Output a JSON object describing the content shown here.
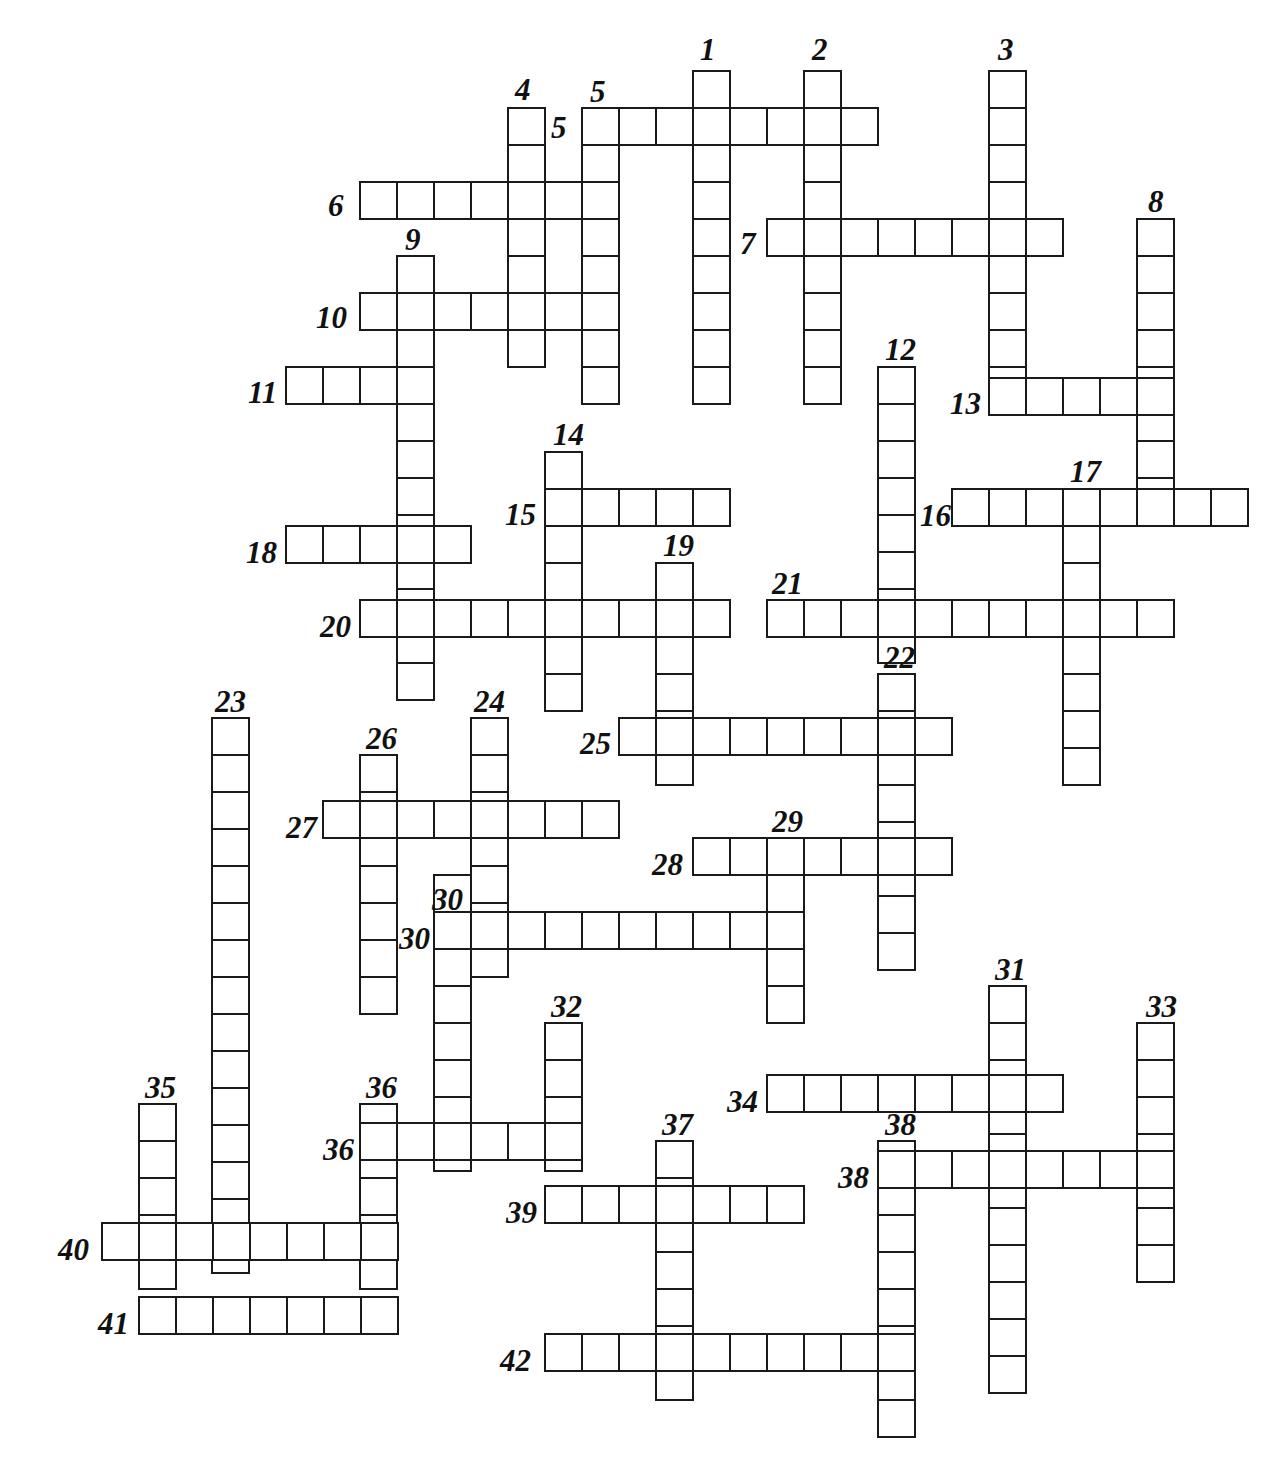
{
  "puzzle": {
    "title": "Crossword Grid",
    "cell_size": 37,
    "line_color": "#1a1a1a",
    "background": "#ffffff",
    "numbers_style": "italic handwritten",
    "entry_count": 42,
    "entries": [
      {
        "number": "1",
        "direction": "down",
        "length": 9,
        "col": 18,
        "row": 0,
        "x": 692,
        "y": 70,
        "label_x": 700,
        "label_y": 34
      },
      {
        "number": "2",
        "direction": "down",
        "length": 9,
        "col": 21,
        "row": 0,
        "x": 803,
        "y": 70,
        "label_x": 812,
        "label_y": 34
      },
      {
        "number": "3",
        "direction": "down",
        "length": 9,
        "col": 26,
        "row": 0,
        "x": 988,
        "y": 70,
        "label_x": 998,
        "label_y": 34
      },
      {
        "number": "4",
        "direction": "down",
        "length": 7,
        "col": 12,
        "row": 1,
        "x": 507,
        "y": 107,
        "label_x": 515,
        "label_y": 74
      },
      {
        "number": "5",
        "direction": "down",
        "length": 8,
        "col": 14,
        "row": 2,
        "x": 581,
        "y": 107,
        "label_x": 590,
        "label_y": 76
      },
      {
        "number": "5",
        "direction": "across",
        "length": 8,
        "col": 14,
        "row": 2,
        "x": 581,
        "y": 107,
        "label_x": 551,
        "label_y": 112
      },
      {
        "number": "6",
        "direction": "across",
        "length": 6,
        "col": 8,
        "row": 4,
        "x": 359,
        "y": 181,
        "label_x": 328,
        "label_y": 190
      },
      {
        "number": "7",
        "direction": "across",
        "length": 8,
        "col": 19,
        "row": 5,
        "x": 766,
        "y": 218,
        "label_x": 740,
        "label_y": 228
      },
      {
        "number": "8",
        "direction": "down",
        "length": 8,
        "col": 29,
        "row": 5,
        "x": 1136,
        "y": 218,
        "label_x": 1148,
        "label_y": 186
      },
      {
        "number": "9",
        "direction": "down",
        "length": 12,
        "col": 9,
        "row": 6,
        "x": 396,
        "y": 255,
        "label_x": 405,
        "label_y": 224
      },
      {
        "number": "10",
        "direction": "across",
        "length": 7,
        "col": 8,
        "row": 7,
        "x": 359,
        "y": 292,
        "label_x": 316,
        "label_y": 302
      },
      {
        "number": "11",
        "direction": "across",
        "length": 4,
        "col": 6,
        "row": 9,
        "x": 285,
        "y": 366,
        "label_x": 248,
        "label_y": 377
      },
      {
        "number": "12",
        "direction": "down",
        "length": 8,
        "col": 22,
        "row": 9,
        "x": 877,
        "y": 366,
        "label_x": 885,
        "label_y": 334
      },
      {
        "number": "13",
        "direction": "across",
        "length": 5,
        "col": 26,
        "row": 10,
        "x": 988,
        "y": 377,
        "label_x": 950,
        "label_y": 388
      },
      {
        "number": "14",
        "direction": "down",
        "length": 7,
        "col": 14,
        "row": 12,
        "x": 544,
        "y": 451,
        "label_x": 553,
        "label_y": 419
      },
      {
        "number": "15",
        "direction": "across",
        "length": 5,
        "col": 14,
        "row": 13,
        "x": 544,
        "y": 488,
        "label_x": 505,
        "label_y": 499
      },
      {
        "number": "16",
        "direction": "across",
        "length": 8,
        "col": 25,
        "row": 13,
        "x": 951,
        "y": 488,
        "label_x": 920,
        "label_y": 500
      },
      {
        "number": "17",
        "direction": "down",
        "length": 8,
        "col": 28,
        "row": 13,
        "x": 1062,
        "y": 488,
        "label_x": 1070,
        "label_y": 456
      },
      {
        "number": "18",
        "direction": "across",
        "length": 5,
        "col": 6,
        "row": 14,
        "x": 285,
        "y": 525,
        "label_x": 246,
        "label_y": 537
      },
      {
        "number": "19",
        "direction": "down",
        "length": 6,
        "col": 17,
        "row": 15,
        "x": 655,
        "y": 562,
        "label_x": 663,
        "label_y": 530
      },
      {
        "number": "20",
        "direction": "across",
        "length": 10,
        "col": 8,
        "row": 16,
        "x": 359,
        "y": 599,
        "label_x": 320,
        "label_y": 611
      },
      {
        "number": "21",
        "direction": "across",
        "length": 11,
        "col": 19,
        "row": 16,
        "x": 766,
        "y": 599,
        "label_x": 772,
        "label_y": 568
      },
      {
        "number": "22",
        "direction": "down",
        "length": 8,
        "col": 22,
        "row": 17,
        "x": 877,
        "y": 673,
        "label_x": 884,
        "label_y": 642
      },
      {
        "number": "23",
        "direction": "down",
        "length": 15,
        "col": 5,
        "row": 18,
        "x": 211,
        "y": 717,
        "label_x": 215,
        "label_y": 686
      },
      {
        "number": "24",
        "direction": "down",
        "length": 7,
        "col": 12,
        "row": 18,
        "x": 470,
        "y": 717,
        "label_x": 474,
        "label_y": 686
      },
      {
        "number": "25",
        "direction": "across",
        "length": 9,
        "col": 16,
        "row": 18,
        "x": 618,
        "y": 717,
        "label_x": 580,
        "label_y": 728
      },
      {
        "number": "26",
        "direction": "down",
        "length": 7,
        "col": 9,
        "row": 19,
        "x": 359,
        "y": 754,
        "label_x": 366,
        "label_y": 723
      },
      {
        "number": "27",
        "direction": "across",
        "length": 8,
        "col": 8,
        "row": 20,
        "x": 322,
        "y": 800,
        "label_x": 286,
        "label_y": 812
      },
      {
        "number": "28",
        "direction": "across",
        "length": 7,
        "col": 18,
        "row": 22,
        "x": 692,
        "y": 837,
        "label_x": 652,
        "label_y": 849
      },
      {
        "number": "29",
        "direction": "down",
        "length": 5,
        "col": 20,
        "row": 22,
        "x": 766,
        "y": 837,
        "label_x": 772,
        "label_y": 806
      },
      {
        "number": "30",
        "direction": "down",
        "length": 8,
        "col": 11,
        "row": 23,
        "x": 433,
        "y": 874,
        "label_x": 432,
        "label_y": 884
      },
      {
        "number": "30",
        "direction": "across",
        "length": 10,
        "col": 11,
        "row": 24,
        "x": 433,
        "y": 911,
        "label_x": 399,
        "label_y": 923
      },
      {
        "number": "31",
        "direction": "down",
        "length": 11,
        "col": 26,
        "row": 26,
        "x": 988,
        "y": 985,
        "label_x": 995,
        "label_y": 954
      },
      {
        "number": "32",
        "direction": "down",
        "length": 4,
        "col": 14,
        "row": 27,
        "x": 544,
        "y": 1022,
        "label_x": 551,
        "label_y": 991
      },
      {
        "number": "33",
        "direction": "down",
        "length": 7,
        "col": 30,
        "row": 27,
        "x": 1136,
        "y": 1022,
        "label_x": 1146,
        "label_y": 991
      },
      {
        "number": "34",
        "direction": "across",
        "length": 8,
        "col": 20,
        "row": 28,
        "x": 766,
        "y": 1074,
        "label_x": 727,
        "label_y": 1086
      },
      {
        "number": "35",
        "direction": "down",
        "length": 5,
        "col": 3,
        "row": 28,
        "x": 138,
        "y": 1103,
        "label_x": 145,
        "label_y": 1072
      },
      {
        "number": "36",
        "direction": "down",
        "length": 5,
        "col": 9,
        "row": 28,
        "x": 359,
        "y": 1103,
        "label_x": 366,
        "label_y": 1072
      },
      {
        "number": "36",
        "direction": "across",
        "length": 6,
        "col": 9,
        "row": 29,
        "x": 359,
        "y": 1122,
        "label_x": 323,
        "label_y": 1134
      },
      {
        "number": "37",
        "direction": "down",
        "length": 7,
        "col": 17,
        "row": 29,
        "x": 655,
        "y": 1140,
        "label_x": 662,
        "label_y": 1109
      },
      {
        "number": "38",
        "direction": "down",
        "length": 8,
        "col": 23,
        "row": 29,
        "x": 877,
        "y": 1140,
        "label_x": 885,
        "label_y": 1109
      },
      {
        "number": "38",
        "direction": "across",
        "length": 8,
        "col": 23,
        "row": 30,
        "x": 877,
        "y": 1150,
        "label_x": 838,
        "label_y": 1162
      },
      {
        "number": "39",
        "direction": "across",
        "length": 7,
        "col": 14,
        "row": 31,
        "x": 544,
        "y": 1185,
        "label_x": 506,
        "label_y": 1197
      },
      {
        "number": "40",
        "direction": "across",
        "length": 8,
        "col": 2,
        "row": 32,
        "x": 101,
        "y": 1222,
        "label_x": 58,
        "label_y": 1234
      },
      {
        "number": "41",
        "direction": "across",
        "length": 7,
        "col": 3,
        "row": 34,
        "x": 138,
        "y": 1296,
        "label_x": 98,
        "label_y": 1308
      },
      {
        "number": "42",
        "direction": "across",
        "length": 10,
        "col": 14,
        "row": 36,
        "x": 544,
        "y": 1333,
        "label_x": 500,
        "label_y": 1345
      }
    ]
  }
}
